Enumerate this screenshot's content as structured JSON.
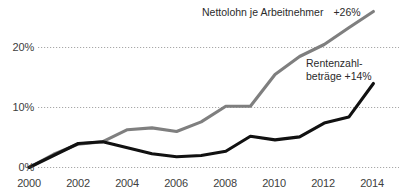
{
  "chart_data": {
    "type": "line",
    "title": "",
    "subtitle": "",
    "xlabel": "",
    "ylabel": "",
    "x": [
      2000,
      2001,
      2002,
      2003,
      2004,
      2005,
      2006,
      2007,
      2008,
      2009,
      2010,
      2011,
      2012,
      2013,
      2014
    ],
    "xlim": [
      2000,
      2014
    ],
    "ylim": [
      0,
      26
    ],
    "grid": true,
    "grid_style": "dotted-horizontal",
    "legend_position": "inline-annotations",
    "xtick_labels": [
      "2000",
      "2002",
      "2004",
      "2006",
      "2008",
      "2010",
      "2012",
      "2014"
    ],
    "xtick_values": [
      2000,
      2002,
      2004,
      2006,
      2008,
      2010,
      2012,
      2014
    ],
    "ytick_labels": [
      "0%",
      "10%",
      "20%"
    ],
    "ytick_values": [
      0,
      10,
      20
    ],
    "series": [
      {
        "name": "Nettolohn je Arbeitnehmer",
        "color": "#7f7f7f",
        "end_label": "+26%",
        "values": [
          0,
          2.2,
          3.9,
          4.3,
          6.3,
          6.6,
          6.0,
          7.6,
          10.2,
          10.2,
          15.5,
          18.5,
          20.5,
          23.3,
          26.0
        ]
      },
      {
        "name": "Rentenzahlbeträge",
        "color": "#111111",
        "end_label": "+14%",
        "values": [
          0,
          2.0,
          4.0,
          4.3,
          3.3,
          2.3,
          1.8,
          2.0,
          2.7,
          5.2,
          4.6,
          5.1,
          7.4,
          8.4,
          14.0
        ]
      }
    ],
    "annotations": [
      {
        "id": "nettolohn-annotation",
        "text": "Nettolohn je Arbeitnehmer",
        "value_text": "+26%",
        "lines": [
          "Nettolohn je Arbeitnehmer",
          "+26%"
        ]
      },
      {
        "id": "renten-annotation",
        "text": "Rentenzahl-beträge +14%",
        "lines": [
          "Rentenzahl-",
          "beträge +14%"
        ]
      }
    ]
  },
  "axis": {
    "y": {
      "ticks": [
        {
          "label": "20%",
          "value": 20
        },
        {
          "label": "10%",
          "value": 10
        },
        {
          "label": "0%",
          "value": 0
        }
      ]
    },
    "x": {
      "ticks": [
        {
          "label": "2000",
          "value": 2000
        },
        {
          "label": "2002",
          "value": 2002
        },
        {
          "label": "2004",
          "value": 2004
        },
        {
          "label": "2006",
          "value": 2006
        },
        {
          "label": "2008",
          "value": 2008
        },
        {
          "label": "2010",
          "value": 2010
        },
        {
          "label": "2012",
          "value": 2012
        },
        {
          "label": "2014",
          "value": 2014
        }
      ]
    }
  },
  "annotations": {
    "nettolohn": {
      "name": "Nettolohn je Arbeitnehmer",
      "percent": "+26%"
    },
    "renten": {
      "line1": "Rentenzahl-",
      "line2": "beträge +14%"
    }
  },
  "colors": {
    "gray_series": "#7f7f7f",
    "black_series": "#111111",
    "gridline": "#a8a8a8",
    "tick_text": "#404040",
    "annotation_text": "#2b2b2b",
    "background": "#ffffff"
  }
}
